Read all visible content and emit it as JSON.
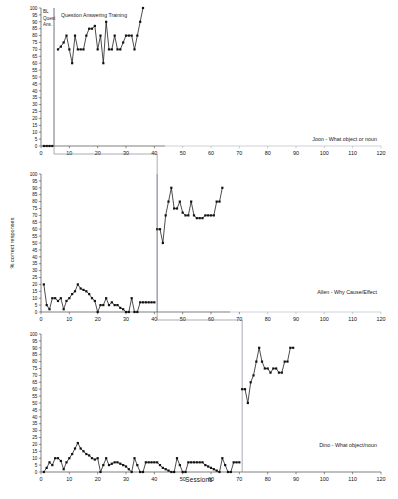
{
  "figure": {
    "xlabel": "Sessions",
    "ylabel": "% correct responses"
  },
  "chart_data": {
    "type": "line",
    "title": "",
    "xlabel": "Sessions",
    "ylabel": "% correct responses",
    "xlim": [
      0,
      120
    ],
    "ylim": [
      0,
      100
    ],
    "xticks": [
      0,
      10,
      20,
      30,
      40,
      50,
      60,
      70,
      80,
      90,
      100,
      110,
      120
    ],
    "yticks": [
      0,
      5,
      10,
      15,
      20,
      25,
      30,
      35,
      40,
      45,
      50,
      55,
      60,
      65,
      70,
      75,
      80,
      85,
      90,
      95,
      100
    ],
    "grid": false,
    "legend_position": "inside bottom-right of each panel",
    "design": "multiple-baseline across participants",
    "panels": [
      {
        "id": "panel-joon",
        "legend": "Joon - What object or noun",
        "phase_labels": [
          {
            "text": "BL\nQuest\nAns.",
            "lines": [
              "BL",
              "Quest",
              "Ans."
            ]
          },
          {
            "text": "Question Answering Training",
            "lines": [
              "Question Answering Training"
            ]
          }
        ],
        "phase_change_session": 4.6,
        "baseline": {
          "name": "Baseline",
          "x": [
            1,
            2,
            3,
            4
          ],
          "y": [
            0,
            0,
            0,
            0
          ]
        },
        "treatment": {
          "name": "Question Answering Training",
          "x": [
            6,
            7,
            8,
            9,
            10,
            11,
            12,
            13,
            14,
            15,
            16,
            17,
            18,
            19,
            20,
            21,
            22,
            23,
            24,
            25,
            26,
            27,
            28,
            29,
            30,
            31,
            32,
            33,
            34,
            35,
            36
          ],
          "y": [
            70,
            72,
            75,
            80,
            70,
            60,
            80,
            70,
            70,
            70,
            80,
            85,
            85,
            87,
            70,
            80,
            60,
            90,
            70,
            70,
            80,
            70,
            70,
            75,
            80,
            80,
            80,
            70,
            80,
            90,
            100
          ]
        }
      },
      {
        "id": "panel-allen",
        "legend": "Allen - Why Cause/Effect",
        "phase_change_session": 41,
        "baseline": {
          "name": "Baseline",
          "x": [
            1,
            2,
            3,
            4,
            5,
            6,
            7,
            8,
            9,
            10,
            11,
            12,
            13,
            14,
            15,
            16,
            17,
            18,
            19,
            20,
            21,
            22,
            23,
            24,
            25,
            26,
            27,
            28,
            29,
            30,
            31,
            32,
            33,
            34,
            35,
            36,
            37,
            38,
            39,
            40
          ],
          "y": [
            20,
            5,
            2,
            10,
            10,
            8,
            10,
            2,
            8,
            10,
            13,
            15,
            20,
            17,
            16,
            15,
            13,
            10,
            8,
            0,
            5,
            5,
            10,
            5,
            7,
            5,
            5,
            3,
            2,
            0,
            0,
            10,
            0,
            0,
            7,
            7,
            7,
            7,
            7,
            7
          ]
        },
        "treatment": {
          "name": "Question Answering Training",
          "x": [
            41,
            42,
            43,
            44,
            45,
            46,
            47,
            48,
            49,
            50,
            51,
            52,
            53,
            54,
            55,
            56,
            57,
            58,
            59,
            60,
            61,
            62,
            63,
            64
          ],
          "y": [
            60,
            60,
            50,
            70,
            80,
            90,
            75,
            75,
            80,
            72,
            70,
            70,
            80,
            70,
            68,
            68,
            68,
            70,
            70,
            70,
            70,
            80,
            80,
            90
          ]
        }
      },
      {
        "id": "panel-dino",
        "legend": "Dino - What object/noun",
        "phase_change_session": 71,
        "baseline": {
          "name": "Baseline",
          "x": [
            1,
            2,
            3,
            4,
            5,
            6,
            7,
            8,
            9,
            10,
            11,
            12,
            13,
            14,
            15,
            16,
            17,
            18,
            19,
            20,
            21,
            22,
            23,
            24,
            25,
            26,
            27,
            28,
            29,
            30,
            31,
            32,
            33,
            34,
            35,
            36,
            37,
            38,
            39,
            40,
            41,
            42,
            43,
            44,
            45,
            46,
            47,
            48,
            49,
            50,
            51,
            52,
            53,
            54,
            55,
            56,
            57,
            58,
            59,
            60,
            61,
            62,
            63,
            64,
            65,
            66,
            67,
            68,
            69,
            70
          ],
          "y": [
            0,
            3,
            7,
            5,
            10,
            10,
            8,
            2,
            7,
            10,
            13,
            17,
            21,
            17,
            15,
            13,
            12,
            10,
            9,
            10,
            0,
            5,
            10,
            5,
            6,
            7,
            7,
            6,
            5,
            4,
            2,
            0,
            10,
            5,
            0,
            0,
            7,
            7,
            7,
            7,
            7,
            5,
            3,
            2,
            1,
            0,
            0,
            10,
            5,
            0,
            0,
            7,
            7,
            7,
            7,
            7,
            7,
            5,
            4,
            3,
            2,
            1,
            0,
            10,
            5,
            0,
            0,
            7,
            7,
            7
          ]
        },
        "treatment": {
          "name": "Question Answering Training",
          "x": [
            71,
            72,
            73,
            74,
            75,
            76,
            77,
            78,
            79,
            80,
            81,
            82,
            83,
            84,
            85,
            86,
            87,
            88,
            89
          ],
          "y": [
            60,
            60,
            50,
            65,
            70,
            80,
            90,
            80,
            75,
            75,
            72,
            75,
            75,
            72,
            72,
            80,
            80,
            90,
            90
          ]
        }
      }
    ]
  }
}
